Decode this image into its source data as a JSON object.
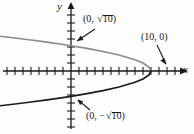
{
  "figure": {
    "kind": "coordinate-graph",
    "background_color": "#fdfdfc"
  },
  "axes": {
    "x_label": "x",
    "y_label": "y",
    "axis_color": "#1a1a1a",
    "origin_px": [
      71,
      71
    ],
    "tick_spacing_px": 8,
    "x_ticks_left": 8,
    "x_ticks_right": 13,
    "y_ticks_up": 7,
    "y_ticks_down": 7,
    "tick_half_length_px": 4,
    "arrows": [
      "x-right",
      "y-up"
    ]
  },
  "labels": [
    {
      "id": "top",
      "open_paren": "(",
      "x_value": "0",
      "separator": ", ",
      "radical": "√",
      "radicand": "10",
      "close_paren": ")",
      "text": "(0, √10)",
      "arrow_from_px": [
        95,
        29
      ],
      "arrow_to_px": [
        74,
        43
      ]
    },
    {
      "id": "right",
      "open_paren": "(",
      "x_value": "10",
      "separator": ", ",
      "y_value": "0",
      "close_paren": ")",
      "text": "(10, 0)",
      "arrow_from_px": [
        158,
        45
      ],
      "arrow_to_px": [
        167,
        66
      ]
    },
    {
      "id": "bottom",
      "open_paren": "(",
      "x_value": "0",
      "separator": ", ",
      "minus": "−",
      "radical": "√",
      "radicand": "10",
      "close_paren": ")",
      "text": "(0, −√10)",
      "arrow_from_px": [
        90,
        110
      ],
      "arrow_to_px": [
        76,
        99
      ]
    }
  ],
  "chart_data": {
    "type": "line",
    "title": "",
    "xlabel": "x",
    "ylabel": "y",
    "equation": "x = 10 − y²",
    "curve_name": "leftward-opening parabola",
    "vertex": [
      10,
      0
    ],
    "y_intercepts": [
      [
        0,
        3.162
      ],
      [
        0,
        -3.162
      ]
    ],
    "x_intercept": [
      10,
      0
    ],
    "xlim": [
      -9,
      14
    ],
    "ylim": [
      -7,
      7
    ],
    "grid": false,
    "legend": null,
    "series": [
      {
        "name": "upper branch",
        "color": "#8a8a8a",
        "points": [
          [
            -9,
            4.359
          ],
          [
            -7,
            4.123
          ],
          [
            -5,
            3.873
          ],
          [
            -3,
            3.606
          ],
          [
            -1,
            3.317
          ],
          [
            0,
            3.162
          ],
          [
            2,
            2.828
          ],
          [
            4,
            2.449
          ],
          [
            6,
            2.0
          ],
          [
            8,
            1.414
          ],
          [
            9,
            1.0
          ],
          [
            9.75,
            0.5
          ],
          [
            10,
            0
          ]
        ]
      },
      {
        "name": "lower branch",
        "color": "#1a1a1a",
        "points": [
          [
            -9,
            -4.359
          ],
          [
            -7,
            -4.123
          ],
          [
            -5,
            -3.873
          ],
          [
            -3,
            -3.606
          ],
          [
            -1,
            -3.317
          ],
          [
            0,
            -3.162
          ],
          [
            2,
            -2.828
          ],
          [
            4,
            -2.449
          ],
          [
            6,
            -2.0
          ],
          [
            8,
            -1.414
          ],
          [
            9,
            -1.0
          ],
          [
            9.75,
            -0.5
          ],
          [
            10,
            0
          ]
        ]
      }
    ]
  }
}
